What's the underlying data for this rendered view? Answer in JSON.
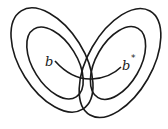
{
  "diagram": {
    "type": "overlapping nested ellipses",
    "left_ellipses": {
      "count": 2,
      "tilt": "top-left to bottom-right"
    },
    "right_ellipses": {
      "count": 2,
      "tilt": "top-right to bottom-left"
    },
    "labels": {
      "left_point": "b",
      "right_point": "b",
      "right_point_superscript": "*"
    },
    "connector": "curved arc from b to b* passing through overlap region",
    "stroke_color": "#1a1a1a",
    "background": "#ffffff"
  }
}
